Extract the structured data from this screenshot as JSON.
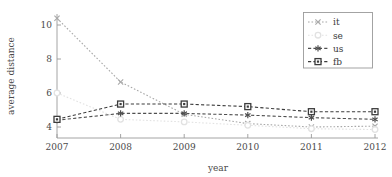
{
  "chart_data": {
    "type": "line",
    "title": "",
    "xlabel": "year",
    "ylabel": "average distance",
    "categories": [
      2007,
      2008,
      2009,
      2010,
      2011,
      2012
    ],
    "x": [
      2007,
      2008,
      2009,
      2010,
      2011,
      2012
    ],
    "xlim": [
      2007,
      2012
    ],
    "ylim": [
      3.7,
      10.6
    ],
    "xticks": [
      "2007",
      "2008",
      "2009",
      "2010",
      "2011",
      "2012"
    ],
    "yticks": [
      "4",
      "6",
      "8",
      "10"
    ],
    "ytick_values": [
      4,
      6,
      8,
      10
    ],
    "grid": false,
    "legend_position": "top-right",
    "series": [
      {
        "name": "it",
        "values": [
          10.4,
          6.65,
          4.75,
          4.2,
          4.0,
          4.05
        ],
        "marker": "cross-x",
        "color": "#a8a8a8",
        "linestyle": "dotted"
      },
      {
        "name": "se",
        "values": [
          6.0,
          4.45,
          4.3,
          4.1,
          3.9,
          3.85
        ],
        "marker": "circle",
        "color": "#e2e2e2",
        "linestyle": "dotted"
      },
      {
        "name": "us",
        "values": [
          4.4,
          4.8,
          4.8,
          4.7,
          4.55,
          4.45
        ],
        "marker": "asterisk",
        "color": "#4f4f4f",
        "linestyle": "dashed"
      },
      {
        "name": "fb",
        "values": [
          4.45,
          5.35,
          5.35,
          5.2,
          4.9,
          4.9
        ],
        "marker": "square",
        "color": "#3c3c3c",
        "linestyle": "dashed"
      }
    ]
  },
  "axes": {
    "x_axis_label": "year",
    "y_axis_label": "average distance"
  },
  "legend": {
    "entries": [
      {
        "label": "it"
      },
      {
        "label": "se"
      },
      {
        "label": "us"
      },
      {
        "label": "fb"
      }
    ]
  },
  "colors": {
    "axis": "#9a9a9a",
    "text": "#3a3a3a",
    "legend_border": "#9a9a9a",
    "background": "#ffffff"
  }
}
